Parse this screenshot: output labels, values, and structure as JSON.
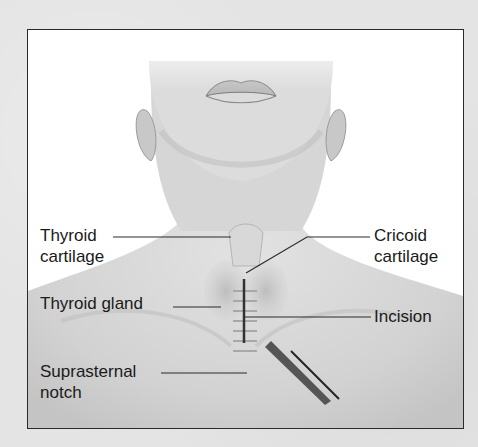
{
  "figure": {
    "labels": {
      "thyroid_cartilage": [
        "Thyroid",
        "cartilage"
      ],
      "thyroid_gland": "Thyroid gland",
      "suprasternal_notch": [
        "Suprasternal",
        "notch"
      ],
      "cricoid_cartilage": [
        "Cricoid",
        "cartilage"
      ],
      "incision": "Incision"
    }
  }
}
